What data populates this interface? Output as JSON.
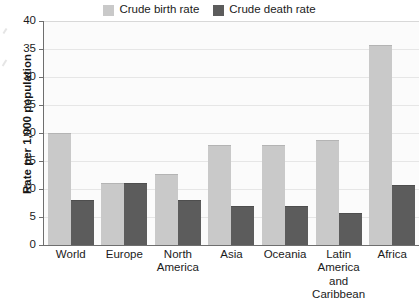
{
  "chart_data": {
    "type": "bar",
    "title": "",
    "subtitle": "",
    "xlabel": "",
    "ylabel": "Rate per 1,000 population",
    "ylim": [
      0,
      40
    ],
    "ytick_step": 5,
    "yticks": [
      "40",
      "35",
      "30",
      "25",
      "20",
      "15",
      "10",
      "5",
      "0"
    ],
    "grid": true,
    "legend_position": "top-center",
    "categories": [
      "World",
      "Europe",
      "North America",
      "Asia",
      "Oceania",
      "Latin America and Caribbean",
      "Africa"
    ],
    "category_lines": [
      [
        "World"
      ],
      [
        "Europe"
      ],
      [
        "North",
        "America"
      ],
      [
        "Asia"
      ],
      [
        "Oceania"
      ],
      [
        "Latin",
        "America",
        "and",
        "Caribbean"
      ],
      [
        "Africa"
      ]
    ],
    "series": [
      {
        "name": "Crude birth rate",
        "color": "#c9c9c9",
        "values": [
          20.0,
          11.0,
          12.7,
          17.8,
          17.8,
          18.8,
          35.7
        ]
      },
      {
        "name": "Crude death rate",
        "color": "#5c5c5c",
        "values": [
          8.0,
          11.0,
          8.0,
          7.0,
          7.0,
          5.8,
          10.8
        ]
      }
    ]
  },
  "legend": {
    "items": [
      {
        "label": "Crude birth rate",
        "swatch": "birth"
      },
      {
        "label": "Crude death rate",
        "swatch": "death"
      }
    ]
  },
  "colors": {
    "birth": "#c9c9c9",
    "death": "#5c5c5c",
    "axis": "#6e6e6e",
    "grid": "#e6e6e6",
    "plot_background": "#fbfbfb",
    "text": "#1b1b1b"
  }
}
